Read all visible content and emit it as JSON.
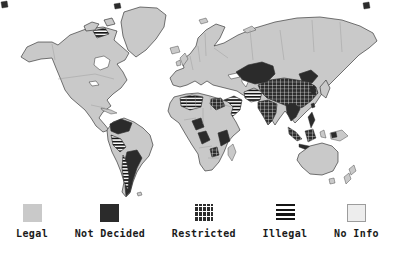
{
  "figure": {
    "kind": "world-choropleth-map",
    "background": "#ffffff",
    "land_default_color": "#c9c9c9",
    "outline_color": "#2e2e2e"
  },
  "legend": {
    "items": [
      {
        "label": "Legal",
        "status": "legal",
        "swatch_color": "#c9c9c9"
      },
      {
        "label": "Not Decided",
        "status": "not-decided",
        "swatch_color": "#2b2b2b"
      },
      {
        "label": "Restricted",
        "status": "restricted",
        "swatch_color": "#2d2d2d",
        "swatch_pattern": "dark-crosshatch-grid",
        "pattern_line_color": "#ffffff"
      },
      {
        "label": "Illegal",
        "status": "illegal",
        "swatch_color": "#161616",
        "swatch_pattern": "horizontal-stripes",
        "pattern_line_color": "#ffffff"
      },
      {
        "label": "No Info",
        "status": "no-info",
        "swatch_color": "#ededed",
        "swatch_border": "#9c9c9c"
      }
    ]
  },
  "map": {
    "regions": [
      {
        "name": "greenland",
        "status": "legal"
      },
      {
        "name": "north-america",
        "status": "legal"
      },
      {
        "name": "arctic-canada-islands",
        "status": "legal"
      },
      {
        "name": "arctic-canada-striped",
        "status": "illegal"
      },
      {
        "name": "caribbean",
        "status": "legal"
      },
      {
        "name": "south-america",
        "status": "legal"
      },
      {
        "name": "colombia-venezuela",
        "status": "not-decided"
      },
      {
        "name": "peru",
        "status": "illegal"
      },
      {
        "name": "chile",
        "status": "illegal"
      },
      {
        "name": "argentina",
        "status": "not-decided"
      },
      {
        "name": "falklands",
        "status": "legal"
      },
      {
        "name": "eurasia",
        "status": "legal"
      },
      {
        "name": "uk",
        "status": "legal"
      },
      {
        "name": "ireland",
        "status": "legal"
      },
      {
        "name": "iceland",
        "status": "legal"
      },
      {
        "name": "novaya-zemlya",
        "status": "legal"
      },
      {
        "name": "svalbard",
        "status": "legal"
      },
      {
        "name": "arctic-islet-west",
        "status": "not-decided"
      },
      {
        "name": "arctic-islet-east",
        "status": "not-decided"
      },
      {
        "name": "arctic-islet-corner",
        "status": "not-decided"
      },
      {
        "name": "kazakhstan-central-asia",
        "status": "not-decided"
      },
      {
        "name": "mongolia-manchuria",
        "status": "not-decided"
      },
      {
        "name": "china",
        "status": "restricted"
      },
      {
        "name": "india",
        "status": "restricted"
      },
      {
        "name": "iran-afghanistan",
        "status": "illegal"
      },
      {
        "name": "arabian-peninsula",
        "status": "illegal"
      },
      {
        "name": "indochina",
        "status": "not-decided"
      },
      {
        "name": "korea",
        "status": "not-decided"
      },
      {
        "name": "japan",
        "status": "legal"
      },
      {
        "name": "taiwan",
        "status": "not-decided"
      },
      {
        "name": "philippines",
        "status": "not-decided"
      },
      {
        "name": "sumatra",
        "status": "restricted"
      },
      {
        "name": "borneo",
        "status": "restricted"
      },
      {
        "name": "java",
        "status": "not-decided"
      },
      {
        "name": "sulawesi",
        "status": "legal"
      },
      {
        "name": "new-guinea",
        "status": "legal"
      },
      {
        "name": "new-guinea-patch",
        "status": "not-decided"
      },
      {
        "name": "australia",
        "status": "legal"
      },
      {
        "name": "tasmania",
        "status": "legal"
      },
      {
        "name": "new-zealand-north",
        "status": "legal"
      },
      {
        "name": "new-zealand-south",
        "status": "legal"
      },
      {
        "name": "africa",
        "status": "legal"
      },
      {
        "name": "algeria",
        "status": "illegal"
      },
      {
        "name": "egypt",
        "status": "restricted"
      },
      {
        "name": "nigeria",
        "status": "not-decided"
      },
      {
        "name": "congo",
        "status": "not-decided"
      },
      {
        "name": "tanzania-kenya",
        "status": "not-decided"
      },
      {
        "name": "zimbabwe",
        "status": "restricted"
      },
      {
        "name": "madagascar",
        "status": "legal"
      }
    ]
  }
}
